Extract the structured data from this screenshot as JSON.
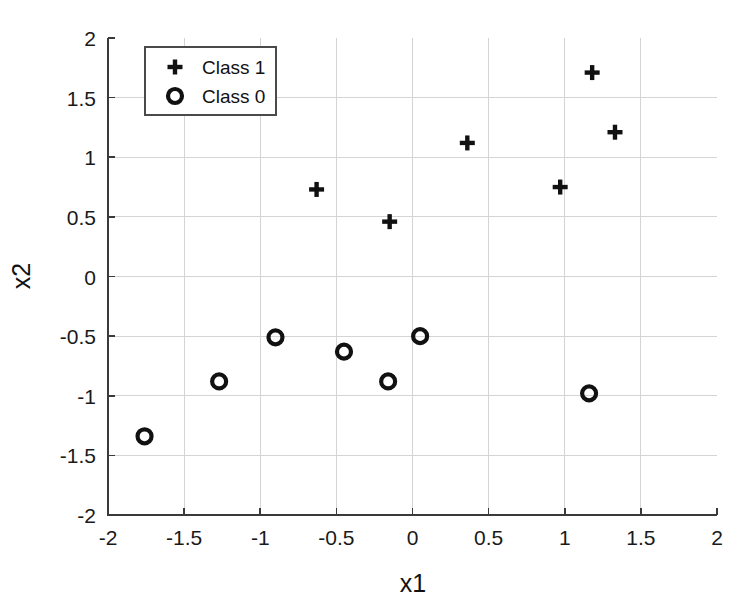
{
  "chart_data": {
    "type": "scatter",
    "title": "",
    "xlabel": "x1",
    "ylabel": "x2",
    "xlim": [
      -2,
      2
    ],
    "ylim": [
      -2,
      2
    ],
    "grid": true,
    "legend_position": "upper left",
    "xticks": [
      "-2",
      "-1.5",
      "-1",
      "-0.5",
      "0",
      "0.5",
      "1",
      "1.5",
      "2"
    ],
    "xtick_values": [
      -2,
      -1.5,
      -1,
      -0.5,
      0,
      0.5,
      1,
      1.5,
      2
    ],
    "yticks": [
      "-2",
      "-1.5",
      "-1",
      "-0.5",
      "0",
      "0.5",
      "1",
      "1.5",
      "2"
    ],
    "ytick_values": [
      -2,
      -1.5,
      -1,
      -0.5,
      0,
      0.5,
      1,
      1.5,
      2
    ],
    "series": [
      {
        "name": "Class 1",
        "marker": "plus",
        "color": "#111111",
        "points": [
          [
            -0.63,
            0.73
          ],
          [
            -0.15,
            0.46
          ],
          [
            0.36,
            1.12
          ],
          [
            0.97,
            0.75
          ],
          [
            1.18,
            1.71
          ],
          [
            1.33,
            1.21
          ]
        ]
      },
      {
        "name": "Class 0",
        "marker": "circle",
        "color": "#111111",
        "points": [
          [
            -1.76,
            -1.34
          ],
          [
            -1.27,
            -0.88
          ],
          [
            -0.9,
            -0.51
          ],
          [
            -0.45,
            -0.63
          ],
          [
            -0.16,
            -0.88
          ],
          [
            0.05,
            -0.5
          ],
          [
            1.16,
            -0.98
          ]
        ]
      }
    ]
  },
  "legend": {
    "entries": [
      {
        "label": "Class 1",
        "marker": "plus"
      },
      {
        "label": "Class 0",
        "marker": "circle"
      }
    ]
  }
}
